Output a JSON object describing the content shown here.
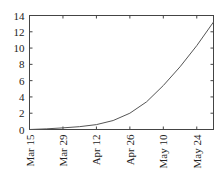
{
  "chart_data": {
    "type": "line",
    "title": "",
    "xlabel": "",
    "ylabel": "",
    "ylim": [
      0,
      14
    ],
    "yticks": [
      0,
      2,
      4,
      6,
      8,
      10,
      12,
      14
    ],
    "xtick_labels": [
      "Mar 15",
      "Mar 29",
      "Apr 12",
      "Apr 26",
      "May 10",
      "May 24"
    ],
    "xtick_days": [
      0,
      14,
      28,
      42,
      56,
      70
    ],
    "xlim_days": [
      0,
      77
    ],
    "grid": false,
    "series": [
      {
        "name": "series-1",
        "color": "#555555",
        "x_days": [
          0,
          7,
          14,
          21,
          28,
          35,
          42,
          49,
          56,
          63,
          70,
          77
        ],
        "values": [
          0.0,
          0.08,
          0.2,
          0.35,
          0.6,
          1.1,
          2.0,
          3.4,
          5.4,
          7.7,
          10.3,
          13.2
        ]
      }
    ]
  }
}
